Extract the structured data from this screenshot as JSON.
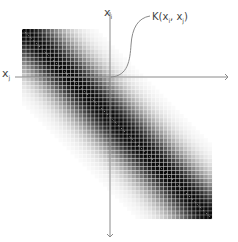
{
  "diagram": {
    "matrix": {
      "x": 22,
      "y": 29,
      "size": 190,
      "cells": 47,
      "bandwidth": 6.5,
      "grid_line_color": "#ffffff",
      "grid_line_opacity": 0.55,
      "diagonal_color": "#9a9a9a"
    },
    "axes": {
      "origin": {
        "x": 110,
        "y": 77
      },
      "color": "#8a8a8a",
      "horizontal": {
        "from_x": 15,
        "to_x": 228,
        "label": "x",
        "subscript": "j"
      },
      "vertical": {
        "from_y": 12,
        "to_y": 237,
        "label": "x",
        "subscript": "i"
      }
    },
    "annotation": {
      "label": "K(x",
      "sub1": "i",
      "mid": ", x",
      "sub2": "j",
      "end": ")",
      "curve_color": "#8a8a8a"
    }
  }
}
